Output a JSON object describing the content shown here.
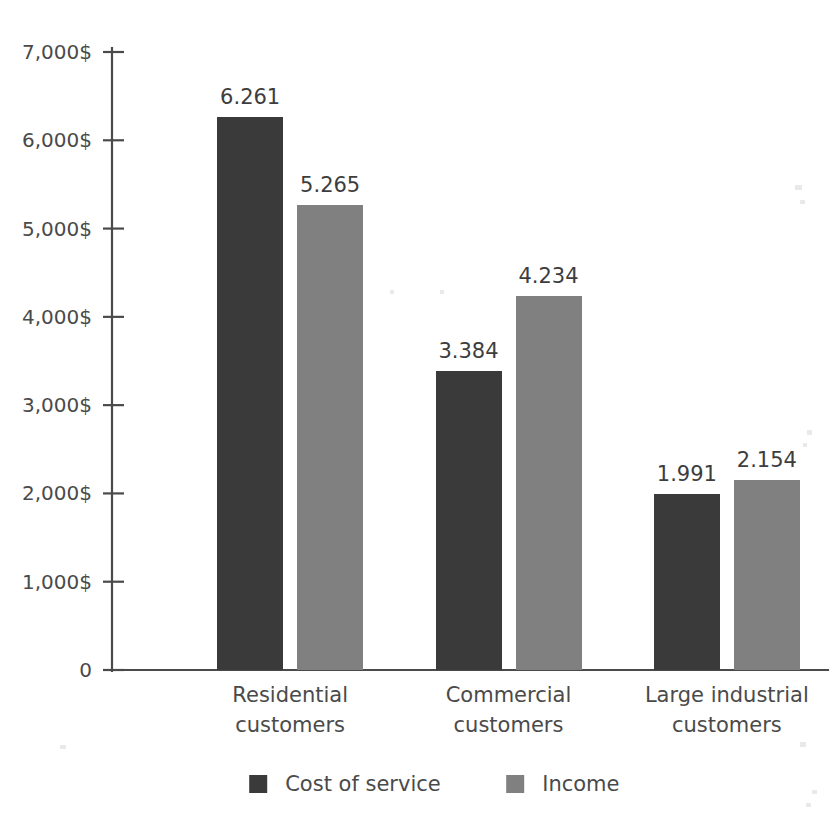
{
  "chart_data": {
    "type": "bar",
    "title": "",
    "subtitle": "",
    "xlabel": "",
    "ylabel": "",
    "categories": [
      "Residential\ncustomers",
      "Commercial\ncustomers",
      "Large industrial\ncustomers"
    ],
    "category_lines": [
      [
        "Residential",
        "customers"
      ],
      [
        "Commercial",
        "customers"
      ],
      [
        "Large industrial",
        "customers"
      ]
    ],
    "series": [
      {
        "name": "Cost of service",
        "color": "#3a3a3a",
        "values": [
          6261,
          3384,
          1991
        ],
        "value_labels": [
          "6.261",
          "3.384",
          "1.991"
        ]
      },
      {
        "name": "Income",
        "color": "#808080",
        "values": [
          5265,
          4234,
          2154
        ],
        "value_labels": [
          "5.265",
          "4.234",
          "2.154"
        ]
      }
    ],
    "ylim": [
      0,
      7000
    ],
    "y_ticks": [
      0,
      1000,
      2000,
      3000,
      4000,
      5000,
      6000,
      7000
    ],
    "y_tick_labels": [
      "0",
      "1,000$",
      "2,000$",
      "3,000$",
      "4,000$",
      "5,000$",
      "6,000$",
      "7,000$"
    ],
    "grid": false,
    "legend_position": "bottom",
    "legend": [
      {
        "label": "Cost of service",
        "color": "#3a3a3a"
      },
      {
        "label": "Income",
        "color": "#808080"
      }
    ]
  },
  "colors": {
    "background": "#ffffff",
    "axis": "#4a4a4a",
    "text": "#4a4a4a",
    "series_dark": "#3a3a3a",
    "series_light": "#808080"
  }
}
